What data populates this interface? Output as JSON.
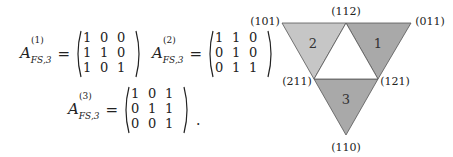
{
  "equations": [
    {
      "lhs_base": "A",
      "lhs_sup": "(1)",
      "lhs_sub": "FS,3",
      "equals": "=",
      "rows": [
        [
          "1",
          "0",
          "0"
        ],
        [
          "1",
          "1",
          "0"
        ],
        [
          "1",
          "0",
          "1"
        ]
      ],
      "trailing": ""
    },
    {
      "lhs_base": "A",
      "lhs_sup": "(2)",
      "lhs_sub": "FS,3",
      "equals": "=",
      "rows": [
        [
          "1",
          "1",
          "0"
        ],
        [
          "0",
          "1",
          "0"
        ],
        [
          "0",
          "1",
          "1"
        ]
      ],
      "trailing": ""
    },
    {
      "lhs_base": "A",
      "lhs_sup": "(3)",
      "lhs_sub": "FS,3",
      "equals": "=",
      "rows": [
        [
          "1",
          "0",
          "1"
        ],
        [
          "0",
          "1",
          "1"
        ],
        [
          "0",
          "0",
          "1"
        ]
      ],
      "trailing": "."
    }
  ],
  "figure": {
    "vertex_labels": {
      "top_left": "(101)",
      "top_mid": "(112)",
      "top_right": "(011)",
      "mid_left": "(211)",
      "mid_right": "(121)",
      "bottom": "(110)"
    },
    "triangle_labels": {
      "t1": "1",
      "t2": "2",
      "t3": "3"
    },
    "colors": {
      "t1": "#a9a9a9",
      "t2": "#c6c6c6",
      "t3": "#a9a9a9",
      "center": "#ffffff",
      "stroke": "#555555"
    }
  }
}
